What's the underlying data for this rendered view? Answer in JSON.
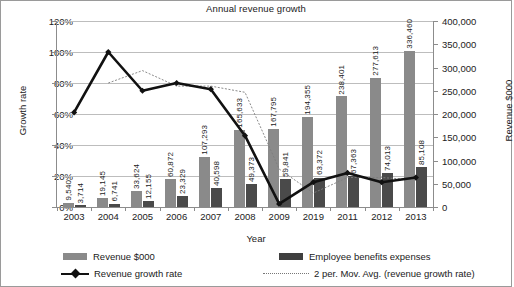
{
  "chart_data": {
    "type": "bar",
    "title": "Annual revenue growth",
    "xlabel": "Year",
    "ylabel": "Growth rate",
    "y2label": "Revenue $000",
    "categories": [
      "2003",
      "2004",
      "2005",
      "2006",
      "2007",
      "2008",
      "2009",
      "2019",
      "2011",
      "2012",
      "2013"
    ],
    "ylim": [
      0,
      1.2
    ],
    "y2lim": [
      0,
      400000
    ],
    "yticks": [
      "0%",
      "20%",
      "40%",
      "60%",
      "80%",
      "100%",
      "120%"
    ],
    "y2ticks": [
      "0",
      "50,000",
      "100,000",
      "150,000",
      "200,000",
      "250,000",
      "300,000",
      "350,000",
      "400,000"
    ],
    "grid": true,
    "legend_position": "bottom",
    "series": [
      {
        "name": "Revenue $000",
        "type": "bar",
        "axis": "right",
        "color": "#8a8a8a",
        "values": [
          9540,
          19145,
          33624,
          60872,
          107293,
          165633,
          167795,
          194355,
          238401,
          277613,
          336460
        ],
        "labels": [
          "9,540",
          "19,145",
          "33,624",
          "60,872",
          "107,293",
          "165,633",
          "167,795",
          "194,355",
          "238,401",
          "277,613",
          "336,460"
        ]
      },
      {
        "name": "Employee benefits expenses",
        "type": "bar",
        "axis": "right",
        "color": "#4a4a4a",
        "values": [
          3714,
          6741,
          12155,
          23329,
          40598,
          49373,
          59841,
          63372,
          67363,
          74013,
          85108
        ],
        "labels": [
          "3,714",
          "6,741",
          "12,155",
          "23,329",
          "40,598",
          "49,373",
          "59,841",
          "63,372",
          "67,363",
          "74,013",
          "85,108"
        ]
      },
      {
        "name": "Revenue growth rate",
        "type": "line",
        "axis": "left",
        "color": "#111111",
        "values": [
          0.61,
          1.0,
          0.75,
          0.8,
          0.76,
          0.46,
          0.02,
          0.16,
          0.22,
          0.16,
          0.19
        ]
      },
      {
        "name": "2 per. Mov. Avg. (revenue growth rate)",
        "type": "line",
        "axis": "left",
        "color": "#7d7d7d",
        "style": "dotted",
        "values": [
          null,
          0.8,
          0.88,
          0.78,
          0.78,
          0.74,
          0.245,
          0.09,
          0.19,
          0.19,
          0.175
        ]
      }
    ]
  },
  "legend": {
    "items": [
      {
        "label": "Revenue $000",
        "marker": "swatch-revenue"
      },
      {
        "label": "Employee benefits expenses",
        "marker": "swatch-expenses"
      },
      {
        "label": "Revenue growth rate",
        "marker": "line-diamond"
      },
      {
        "label": "2 per. Mov. Avg. (revenue growth rate)",
        "marker": "line-dotted"
      }
    ]
  }
}
